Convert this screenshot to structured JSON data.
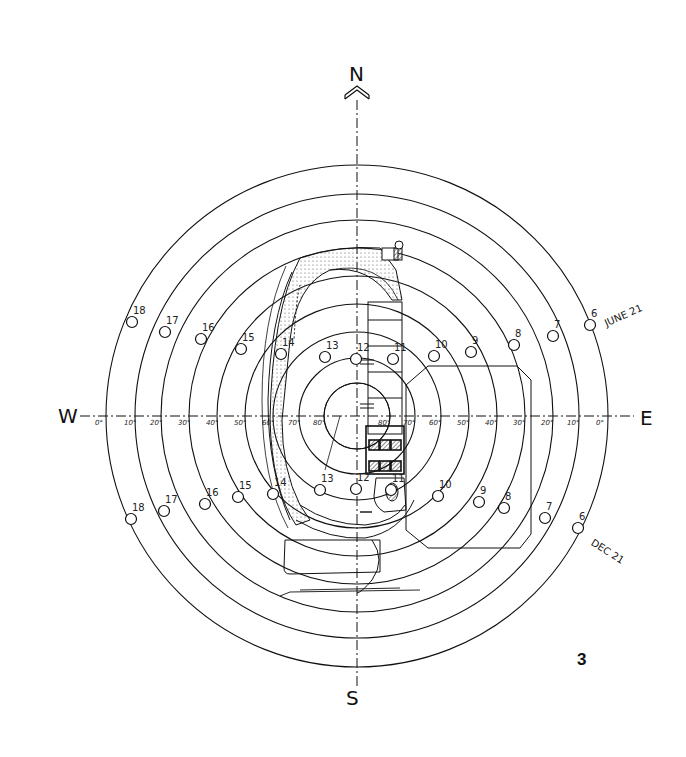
{
  "figure": {
    "number": "3"
  },
  "compass": {
    "north": "N",
    "south": "S",
    "east": "E",
    "west": "W"
  },
  "altitude_rings": {
    "west_labels": [
      "0°",
      "10°",
      "20°",
      "30°",
      "40°",
      "50°",
      "60°",
      "70°",
      "80°"
    ],
    "east_labels": [
      "80°",
      "70°",
      "60°",
      "50°",
      "40°",
      "30°",
      "20°",
      "10°",
      "0°"
    ],
    "radii_px": [
      251,
      222,
      196,
      168,
      140,
      112,
      84,
      58,
      33
    ]
  },
  "sun_paths": {
    "june21": {
      "label": "JUNE 21",
      "hours": [
        {
          "h": "18",
          "x": 132,
          "y": 322
        },
        {
          "h": "17",
          "x": 165,
          "y": 332
        },
        {
          "h": "16",
          "x": 201,
          "y": 339
        },
        {
          "h": "15",
          "x": 241,
          "y": 349
        },
        {
          "h": "14",
          "x": 281,
          "y": 354
        },
        {
          "h": "13",
          "x": 325,
          "y": 357
        },
        {
          "h": "12",
          "x": 356,
          "y": 359
        },
        {
          "h": "11",
          "x": 393,
          "y": 359
        },
        {
          "h": "10",
          "x": 434,
          "y": 356
        },
        {
          "h": "9",
          "x": 471,
          "y": 352
        },
        {
          "h": "8",
          "x": 514,
          "y": 345
        },
        {
          "h": "7",
          "x": 553,
          "y": 336
        },
        {
          "h": "6",
          "x": 590,
          "y": 325
        }
      ]
    },
    "dec21": {
      "label": "DEC 21",
      "hours": [
        {
          "h": "18",
          "x": 131,
          "y": 519
        },
        {
          "h": "17",
          "x": 164,
          "y": 511
        },
        {
          "h": "16",
          "x": 205,
          "y": 504
        },
        {
          "h": "15",
          "x": 238,
          "y": 497
        },
        {
          "h": "14",
          "x": 273,
          "y": 494
        },
        {
          "h": "13",
          "x": 320,
          "y": 490
        },
        {
          "h": "12",
          "x": 356,
          "y": 489
        },
        {
          "h": "11",
          "x": 391,
          "y": 490
        },
        {
          "h": "10",
          "x": 438,
          "y": 496
        },
        {
          "h": "9",
          "x": 479,
          "y": 502
        },
        {
          "h": "8",
          "x": 504,
          "y": 508
        },
        {
          "h": "7",
          "x": 545,
          "y": 518
        },
        {
          "h": "6",
          "x": 578,
          "y": 528
        }
      ]
    }
  },
  "colors": {
    "ink": "#111111",
    "paper": "#ffffff",
    "hatch": "#555555"
  }
}
